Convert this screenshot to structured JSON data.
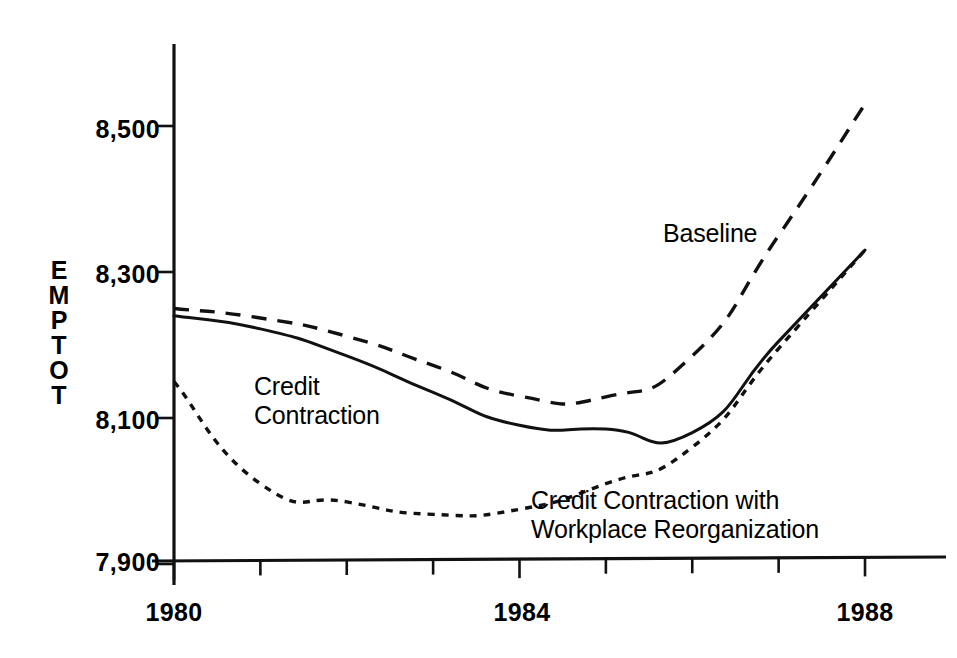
{
  "chart_data": {
    "type": "line",
    "title": "",
    "xlabel": "",
    "ylabel": "EMPTOT",
    "ylabel_letters": [
      "E",
      "M",
      "P",
      "T",
      "O",
      "T"
    ],
    "xlim": [
      1980,
      1988
    ],
    "ylim": [
      7900,
      8560
    ],
    "grid": false,
    "legend_position": "inline-annotations",
    "x_tick_labels": [
      "1980",
      "1984",
      "1988"
    ],
    "x_tick_values": [
      1980,
      1984,
      1988
    ],
    "x_minor_ticks": [
      1981,
      1982,
      1983,
      1985,
      1986,
      1987
    ],
    "y_tick_labels": [
      "8,500",
      "8,300",
      "8,100",
      "7,900"
    ],
    "y_tick_values": [
      8500,
      8300,
      8100,
      7900
    ],
    "x": [
      1980,
      1981,
      1982,
      1983,
      1984,
      1985,
      1986,
      1987,
      1988
    ],
    "series": [
      {
        "name": "Baseline",
        "style": "dashed",
        "label": "Baseline",
        "values": [
          8250,
          8237,
          8212,
          8172,
          8130,
          8129,
          8185,
          8350,
          8530
        ]
      },
      {
        "name": "Credit Contraction",
        "style": "solid",
        "label": "Credit\nContraction",
        "values": [
          8240,
          8222,
          8185,
          8135,
          8090,
          8085,
          8080,
          8205,
          8330
        ]
      },
      {
        "name": "Credit Contraction with Workplace Reorganization",
        "style": "dotted",
        "label": "Credit Contraction with\nWorkplace Reorganization",
        "values": [
          8150,
          8010,
          7985,
          7968,
          7975,
          8010,
          8060,
          8195,
          8330
        ]
      }
    ]
  },
  "annotations": {
    "baseline": "Baseline",
    "credit_contraction_line1": "Credit",
    "credit_contraction_line2": "Contraction",
    "reorg_line1": "Credit Contraction with",
    "reorg_line2": "Workplace Reorganization"
  },
  "axis": {
    "y_label": "EMPTOT"
  },
  "colors": {
    "ink": "#111111",
    "background": "#ffffff"
  }
}
